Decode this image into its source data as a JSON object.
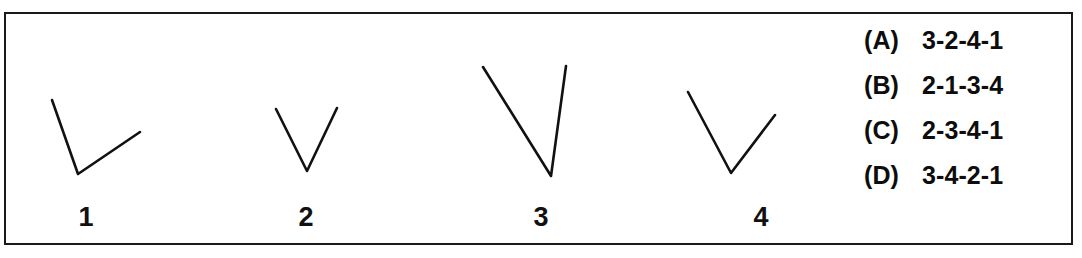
{
  "frame": {
    "border_color": "#1a1a1a",
    "background_color": "#ffffff"
  },
  "ink_color": "#111111",
  "figures": [
    {
      "label": "1",
      "name": "angle-figure-1",
      "vertex": [
        78,
        174
      ],
      "arm_a_end": [
        52,
        100
      ],
      "arm_b_end": [
        140,
        132
      ]
    },
    {
      "label": "2",
      "name": "angle-figure-2",
      "vertex": [
        307,
        171
      ],
      "arm_a_end": [
        276,
        109
      ],
      "arm_b_end": [
        337,
        108
      ]
    },
    {
      "label": "3",
      "name": "angle-figure-3",
      "vertex": [
        551,
        176
      ],
      "arm_a_end": [
        483,
        67
      ],
      "arm_b_end": [
        566,
        66
      ]
    },
    {
      "label": "4",
      "name": "angle-figure-4",
      "vertex": [
        731,
        173
      ],
      "arm_a_end": [
        688,
        92
      ],
      "arm_b_end": [
        775,
        115
      ]
    }
  ],
  "answers": {
    "options": [
      {
        "letter": "(A)",
        "text": "3-2-4-1"
      },
      {
        "letter": "(B)",
        "text": "2-1-3-4"
      },
      {
        "letter": "(C)",
        "text": "2-3-4-1"
      },
      {
        "letter": "(D)",
        "text": "3-4-2-1"
      }
    ]
  }
}
